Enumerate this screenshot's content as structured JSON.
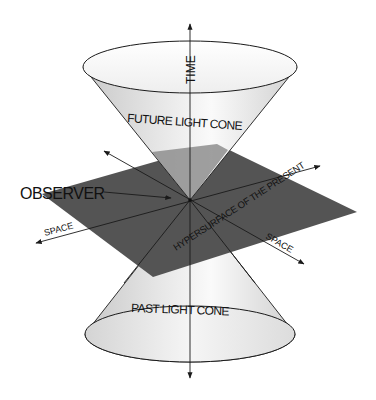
{
  "diagram": {
    "labels": {
      "time": "TIME",
      "future_cone": "FUTURE LIGHT CONE",
      "past_cone": "PAST LIGHT CONE",
      "observer": "OBSERVER",
      "space_left": "SPACE",
      "space_right": "SPACE",
      "hypersurface": "HYPERSURFACE OF THE PRESENT"
    },
    "colors": {
      "plane": "#545454",
      "plane_in_cone": "#8e8e8e",
      "cone_fill_light": "#f4f4f4",
      "cone_fill_dark": "#c4c4c4",
      "line": "#1a1a1a",
      "background": "#ffffff"
    },
    "geometry": {
      "apex": [
        190,
        200
      ],
      "time_axis": {
        "top": [
          190,
          23
        ],
        "bottom": [
          190,
          380
        ]
      },
      "future_ellipse": {
        "cx": 190,
        "cy": 67,
        "rx": 107,
        "ry": 26
      },
      "past_ellipse": {
        "cx": 190,
        "cy": 334,
        "rx": 105,
        "ry": 28
      },
      "plane_corners": [
        [
          217,
          144
        ],
        [
          357,
          212
        ],
        [
          153,
          277
        ],
        [
          42,
          194
        ]
      ],
      "space_axis_1": {
        "from": [
          35,
          243
        ],
        "to": [
          321,
          166
        ]
      },
      "space_axis_2": {
        "from": [
          103,
          150
        ],
        "to": [
          305,
          265
        ]
      },
      "observer_arrow": {
        "from": [
          102,
          192
        ],
        "to": [
          172,
          198
        ]
      }
    }
  }
}
